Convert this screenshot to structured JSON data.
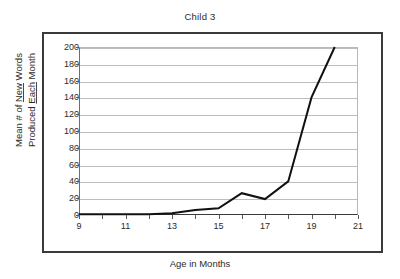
{
  "chart_data": {
    "type": "line",
    "title": "Child 3",
    "xlabel": "Age in Months",
    "ylabel_line1": "Mean # of New Words",
    "ylabel_line2": "Produced Each Month",
    "ylabel_misspelled_words": [
      "New",
      "Each"
    ],
    "x": [
      9,
      10,
      11,
      12,
      13,
      14,
      15,
      16,
      17,
      18,
      19,
      20
    ],
    "values": [
      1,
      1,
      1,
      1,
      2,
      6,
      8,
      26,
      19,
      40,
      140,
      200
    ],
    "series": [
      {
        "name": "Child 3",
        "values": [
          1,
          1,
          1,
          1,
          2,
          6,
          8,
          26,
          19,
          40,
          140,
          200
        ]
      }
    ],
    "xlim": [
      9,
      21
    ],
    "ylim": [
      0,
      200
    ],
    "xticks": [
      9,
      10,
      11,
      12,
      13,
      14,
      15,
      16,
      17,
      18,
      19,
      20,
      21
    ],
    "xtick_labels_shown": [
      9,
      11,
      13,
      15,
      17,
      19,
      21
    ],
    "yticks": [
      0,
      20,
      40,
      60,
      80,
      100,
      120,
      140,
      160,
      180,
      200
    ],
    "ytick_labels": [
      "0",
      "20",
      "40",
      "60",
      "80",
      "100",
      "120",
      "140",
      "160",
      "180",
      "200"
    ],
    "grid": "horizontal",
    "legend": "none",
    "line_color": "#111111",
    "grid_color": "#bcbcbc",
    "frame_color": "#3a3a3a",
    "background_color": "#ffffff"
  }
}
